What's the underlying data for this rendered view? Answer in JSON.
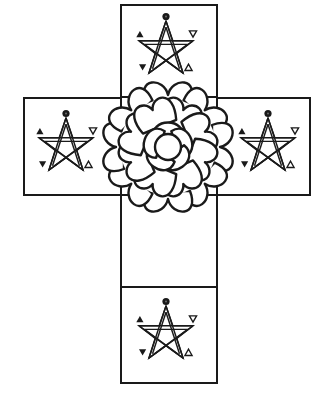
{
  "figure": {
    "stroke_color": "#1a1a1a",
    "background": "#ffffff",
    "arms": [
      {
        "id": "top",
        "symbol": "pentagram",
        "marks": [
          "circle-dot-top",
          "triangle-up-left",
          "triangle-down-right",
          "triangle-down-left",
          "triangle-up-right"
        ]
      },
      {
        "id": "left",
        "symbol": "pentagram",
        "marks": [
          "circle-dot-top",
          "triangle-up-left",
          "triangle-down-right",
          "triangle-down-left",
          "triangle-up-right"
        ]
      },
      {
        "id": "right",
        "symbol": "pentagram",
        "marks": [
          "circle-dot-top",
          "triangle-up-left",
          "triangle-down-right",
          "triangle-down-left",
          "triangle-up-right"
        ]
      },
      {
        "id": "bottom",
        "symbol": "pentagram",
        "marks": [
          "circle-dot-top",
          "triangle-up-left",
          "triangle-down-right",
          "triangle-down-left",
          "triangle-up-right"
        ]
      }
    ],
    "center": {
      "symbol": "rose",
      "petal_rings": 3
    }
  }
}
